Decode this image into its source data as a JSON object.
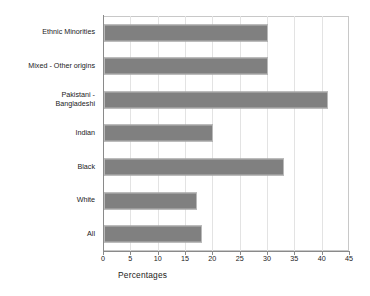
{
  "chart_data": {
    "type": "bar",
    "orientation": "horizontal",
    "title": "",
    "xlabel": "Percentages",
    "ylabel": "",
    "xlim": [
      0,
      45
    ],
    "xticks": [
      0,
      5,
      10,
      15,
      20,
      25,
      30,
      35,
      40,
      45
    ],
    "grid": true,
    "legend": false,
    "bar_color": "#808080",
    "bar_border_color": "#b9b9b9",
    "categories": [
      "Ethnic Minorities",
      "Mixed - Other origins",
      "Pakistani -\nBangladeshi",
      "Indian",
      "Black",
      "White",
      "All"
    ],
    "values": [
      30,
      30,
      41,
      20,
      33,
      17,
      18
    ]
  }
}
